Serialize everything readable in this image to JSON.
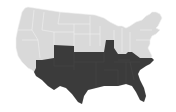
{
  "map": {
    "title": "United States map with southern states highlighted",
    "colors": {
      "background": "#ffffff",
      "unhighlighted": "#d9d9d9",
      "highlighted": "#3b3b3b",
      "border": "#f4f4f4"
    },
    "regions": {
      "highlighted": {
        "label": "Southern states",
        "states": [
          "New Mexico",
          "Oklahoma",
          "Texas",
          "Arkansas",
          "Louisiana",
          "Missouri",
          "Kentucky",
          "Tennessee",
          "Mississippi",
          "Alabama",
          "Georgia",
          "Florida",
          "South Carolina",
          "North Carolina"
        ]
      },
      "unhighlighted": {
        "label": "Other states"
      }
    }
  }
}
